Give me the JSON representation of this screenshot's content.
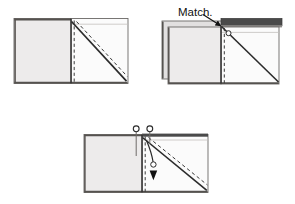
{
  "figure": {
    "type": "instruction-diagram",
    "background_color": "#ffffff",
    "panel_count": 3,
    "annotations": [
      {
        "id": "match-label",
        "text": "Match.",
        "x": 178,
        "y": 16,
        "points_to": "top-center seam intersection of panel 2"
      }
    ],
    "colors": {
      "paper_light": "#edebeb",
      "paper_white": "#fbfbfb",
      "paper_back": "#e2e0e0",
      "dark_strip": "#4a4a4a",
      "edge_dark": "#55524f",
      "outline": "#6b6866",
      "fold_line": "#2b2b2b",
      "dashed_line": "#3a3a3a",
      "arrow": "#111111",
      "pin": "#2a2a2a",
      "text": "#111111"
    }
  },
  "panels": [
    {
      "id": "panel-1",
      "name": "step-1-flat-piece",
      "position": {
        "x": 14,
        "y": 18,
        "width": 114,
        "height": 66
      },
      "description": "Flat rectangular piece with vertical center fold, solid diagonal fold line and parallel dashed stitch line",
      "elements": {
        "left_half_fill": "#edebeb",
        "right_half_fill": "#fbfbfb",
        "center_fold_line": "vertical solid",
        "center_dashed_line": "vertical dashed",
        "diagonal_solid_line": "top-center to bottom-right",
        "diagonal_dashed_line": "parallel offset below diagonal"
      }
    },
    {
      "id": "panel-2",
      "name": "step-2-matched-layers",
      "position": {
        "x": 162,
        "y": 18,
        "width": 120,
        "height": 66
      },
      "description": "Two layers offset, dark strip across top right, pin circle on diagonal, match point arrow",
      "elements": {
        "back_layer_fill": "#e2e0e0",
        "front_left_fill": "#edebeb",
        "front_right_fill": "#fbfbfb",
        "dark_top_strip": "#4a4a4a",
        "pin_circle": true,
        "match_arrow": true
      }
    },
    {
      "id": "panel-3",
      "name": "step-3-pinned-and-fold",
      "position": {
        "x": 84,
        "y": 134,
        "width": 124,
        "height": 60
      },
      "description": "Piece with two pins at top edge and a curved arrow indicating downward fold direction",
      "elements": {
        "left_half_fill": "#edebeb",
        "right_half_fill": "#fbfbfb",
        "dark_top_strip": "#4a4a4a",
        "pin_count": 2,
        "fold_arrow_direction": "down",
        "arrow_has_circle_marker": true
      }
    }
  ]
}
